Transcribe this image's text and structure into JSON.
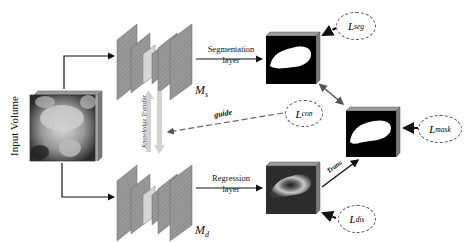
{
  "diagram": {
    "input": {
      "label": "Input Volume"
    },
    "models": {
      "segmentation": {
        "label": "M",
        "subscript": "s"
      },
      "distance": {
        "label": "M",
        "subscript": "d"
      }
    },
    "layers": {
      "segmentation": {
        "line1": "Segmentation",
        "line2": "layer"
      },
      "regression": {
        "line1": "Regression",
        "line2": "layer"
      }
    },
    "arrows": {
      "knowledge_transfer": "Knowledge Transfer",
      "guide": "guide",
      "trans": "Trans"
    },
    "losses": {
      "seg": {
        "base": "L",
        "sub": "seg"
      },
      "con": {
        "base": "L",
        "sub": "con"
      },
      "mask": {
        "base": "L",
        "sub": "mask"
      },
      "dis": {
        "base": "L",
        "sub": "dis"
      }
    },
    "colors": {
      "arrow": "#111111",
      "block": "#8a8a8a",
      "block_light": "#c9c9c9",
      "transfer_arrow": "#cfcfcf",
      "guide_arrow": "#666666"
    }
  }
}
